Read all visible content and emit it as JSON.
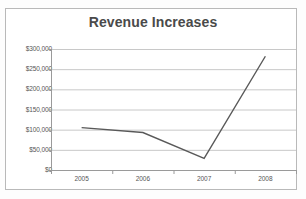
{
  "chart_data": {
    "type": "line",
    "title": "Revenue Increases",
    "xlabel": "",
    "ylabel": "",
    "categories": [
      "2005",
      "2006",
      "2007",
      "2008"
    ],
    "x": [
      2005,
      2006,
      2007,
      2008
    ],
    "values": [
      105000,
      93000,
      29000,
      282000
    ],
    "series": [
      {
        "name": "Revenue",
        "values": [
          105000,
          93000,
          29000,
          282000
        ],
        "color": "#595959"
      }
    ],
    "ylim": [
      0,
      300000
    ],
    "ytick_values": [
      0,
      50000,
      100000,
      150000,
      200000,
      250000,
      300000
    ],
    "ytick_labels": [
      "$0",
      "$50,000",
      "$100,000",
      "$150,000",
      "$200,000",
      "$250,000",
      "$300,000"
    ],
    "xtick_labels": [
      "2005",
      "2006",
      "2007",
      "2008"
    ],
    "grid": true,
    "grid_axis": "y",
    "legend": false,
    "legend_position": "none",
    "markers": false
  },
  "style": {
    "line_color": "#595959",
    "grid_color": "#c8c8c8",
    "axis_color": "#9a9a9a",
    "title_color": "#4a4a4a",
    "tick_label_color": "#565656",
    "frame_color": "#b9b9b9",
    "background": "#ffffff"
  },
  "icons": {
    "chart_type_icon": "line-chart-icon"
  }
}
